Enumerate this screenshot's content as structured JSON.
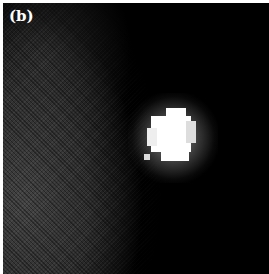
{
  "figure": {
    "panel_label": "(b)",
    "colors": {
      "background": "#000000",
      "noise_region": "#464646",
      "bright_spot": "#ffffff",
      "border": "#ffffff"
    }
  }
}
